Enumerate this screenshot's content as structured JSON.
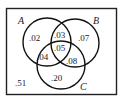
{
  "diagram": {
    "type": "venn",
    "sets": [
      {
        "name": "A"
      },
      {
        "name": "B"
      },
      {
        "name": "C"
      }
    ],
    "regions": {
      "A_only": ".02",
      "B_only": ".07",
      "C_only": ".20",
      "A_and_B_only": ".03",
      "A_and_C_only": ".04",
      "B_and_C_only": ".08",
      "A_B_C": ".05",
      "outside": ".51"
    }
  }
}
